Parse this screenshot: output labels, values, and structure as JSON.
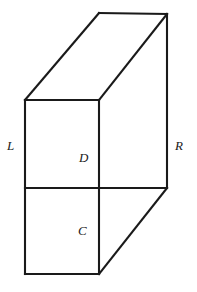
{
  "figure": {
    "type": "line-diagram",
    "background_color": "#ffffff",
    "stroke_color": "#1a1a1a",
    "stroke_width": 2.1,
    "canvas": {
      "width": 197,
      "height": 292
    },
    "vertices": {
      "front_top_left": [
        25,
        100
      ],
      "front_top_right": [
        99,
        100
      ],
      "front_bottom_left": [
        25,
        274
      ],
      "front_bottom_right": [
        99,
        274
      ],
      "back_top_left": [
        99,
        13
      ],
      "back_top_right": [
        167,
        14
      ],
      "back_bottom_right": [
        167,
        188
      ]
    },
    "divider_line": {
      "from": [
        25,
        188
      ],
      "to": [
        99,
        188
      ]
    },
    "faces": [
      {
        "name": "front-face",
        "points": "25,100 99,100 99,274 25,274"
      },
      {
        "name": "top-face",
        "points": "25,100 99,13 167,14 99,100"
      },
      {
        "name": "right-face",
        "points": "99,100 167,14 167,188 99,274"
      }
    ],
    "labels": [
      {
        "id": "L",
        "text": "L",
        "role": "left-face-label",
        "x": 7,
        "y": 139
      },
      {
        "id": "R",
        "text": "R",
        "role": "right-face-label",
        "x": 175,
        "y": 139
      },
      {
        "id": "D",
        "text": "D",
        "role": "upper-front-region-label",
        "x": 79,
        "y": 151
      },
      {
        "id": "C",
        "text": "C",
        "role": "lower-front-region-label",
        "x": 78,
        "y": 224
      }
    ]
  }
}
